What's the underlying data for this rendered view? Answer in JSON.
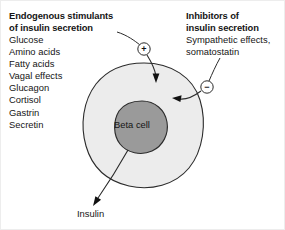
{
  "figure": {
    "background_color": "#ffffff",
    "frame_color": "#ededed"
  },
  "left_panel": {
    "heading_line1": "Endogenous stimulants",
    "heading_line2": "of insulin secretion",
    "items": [
      "Glucose",
      "Amino acids",
      "Fatty acids",
      "Vagal effects",
      "Glucagon",
      "Cortisol",
      "Gastrin",
      "Secretin"
    ]
  },
  "right_panel": {
    "heading_line1": "Inhibitors of",
    "heading_line2": "insulin secretion",
    "items": [
      "Sympathetic effects,",
      "somatostatin"
    ]
  },
  "cell": {
    "label": "Beta cell",
    "cytoplasm_color": "#ececec",
    "nucleus_color": "#9a9a9a",
    "outline_color": "#2b2b2b"
  },
  "output": {
    "label": "Insulin"
  },
  "signs": {
    "stimulant": "+",
    "inhibitor": "−"
  }
}
